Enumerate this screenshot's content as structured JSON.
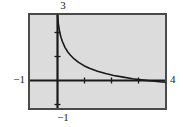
{
  "figure": {
    "background_color": "#ffffff",
    "plot_background_color": "#dcdcdc",
    "frame_color": "#4a4a4a",
    "axis_color": "#1a1a1a",
    "curve_color": "#1a1a1a"
  },
  "labels": {
    "y_max": "3",
    "y_min": "−1",
    "x_min": "−1",
    "x_max": "4"
  },
  "chart_data": {
    "type": "line",
    "title": "",
    "subtitle": "",
    "xlabel": "",
    "ylabel": "",
    "xlim": [
      -1,
      4
    ],
    "ylim": [
      -1,
      3
    ],
    "grid": false,
    "legend": null,
    "legend_position": "none",
    "x_tick_labels": [
      "−1",
      "4"
    ],
    "y_tick_labels": [
      "−1",
      "3"
    ],
    "x_ticks": [
      0,
      1,
      2,
      3
    ],
    "y_ticks": [
      0,
      1,
      2
    ],
    "annotations": [],
    "series": [
      {
        "name": "curve",
        "description": "decaying curve from upper left approaching the x-axis asymptotically",
        "x": [
          0.02,
          0.05,
          0.1,
          0.15,
          0.2,
          0.3,
          0.4,
          0.5,
          0.6,
          0.8,
          1.0,
          1.2,
          1.5,
          1.8,
          2.1,
          2.4,
          2.8,
          3.2,
          3.6,
          4.0
        ],
        "y": [
          3.0,
          2.62,
          2.26,
          2.03,
          1.86,
          1.6,
          1.41,
          1.27,
          1.15,
          0.96,
          0.82,
          0.71,
          0.58,
          0.48,
          0.4,
          0.34,
          0.26,
          0.2,
          0.15,
          0.11
        ]
      }
    ]
  }
}
